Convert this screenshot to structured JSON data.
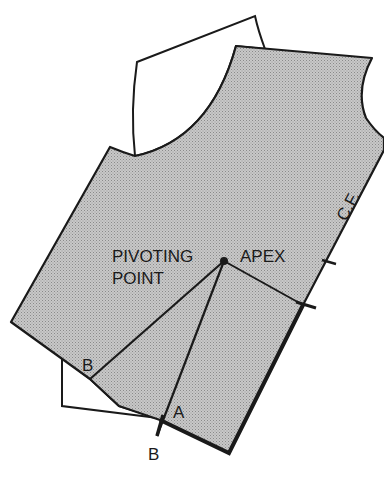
{
  "diagram": {
    "type": "sewing-pattern-dart-pivot",
    "colors": {
      "pattern_fill": "#bdbdbd",
      "back_piece_fill": "#ffffff",
      "line": "#1a1a1a"
    },
    "labels": {
      "pivoting_line1": "PIVOTING",
      "pivoting_line2": "POINT",
      "apex": "APEX",
      "b_upper": "B",
      "a": "A",
      "b_lower": "B",
      "center_front": "C.F."
    }
  }
}
